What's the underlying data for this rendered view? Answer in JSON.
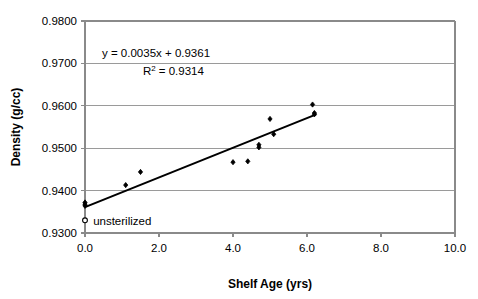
{
  "chart_data": {
    "type": "scatter",
    "title": "",
    "xlabel": "Shelf Age (yrs)",
    "ylabel": "Density (g/cc)",
    "xlim": [
      0.0,
      10.0
    ],
    "ylim": [
      0.93,
      0.98
    ],
    "xticks": [
      "0.0",
      "2.0",
      "4.0",
      "6.0",
      "8.0",
      "10.0"
    ],
    "xtick_values": [
      0.0,
      2.0,
      4.0,
      6.0,
      8.0,
      10.0
    ],
    "yticks": [
      "0.9300",
      "0.9400",
      "0.9500",
      "0.9600",
      "0.9700",
      "0.9800"
    ],
    "ytick_values": [
      0.93,
      0.94,
      0.95,
      0.96,
      0.97,
      0.98
    ],
    "grid": "horizontal",
    "legend": "none",
    "series": [
      {
        "name": "sterilized",
        "marker": "filled-diamond",
        "color": "#000000",
        "points": [
          {
            "x": 0.0,
            "y": 0.9372
          },
          {
            "x": 0.0,
            "y": 0.9368
          },
          {
            "x": 0.0,
            "y": 0.9364
          },
          {
            "x": 1.1,
            "y": 0.9413
          },
          {
            "x": 1.5,
            "y": 0.9444
          },
          {
            "x": 4.0,
            "y": 0.9467
          },
          {
            "x": 4.4,
            "y": 0.9469
          },
          {
            "x": 4.7,
            "y": 0.9508
          },
          {
            "x": 4.7,
            "y": 0.9502
          },
          {
            "x": 5.0,
            "y": 0.9569
          },
          {
            "x": 5.1,
            "y": 0.9533
          },
          {
            "x": 6.15,
            "y": 0.9603
          },
          {
            "x": 6.2,
            "y": 0.9583
          },
          {
            "x": 6.2,
            "y": 0.958
          }
        ]
      },
      {
        "name": "unsterilized",
        "marker": "hollow-circle",
        "color": "#000000",
        "points": [
          {
            "x": 0.0,
            "y": 0.933
          }
        ]
      }
    ],
    "trendline": {
      "equation": "y = 0.0035x + 0.9361",
      "slope": 0.0035,
      "intercept": 0.9361,
      "r_squared_label": "R",
      "r_squared_exponent": "2",
      "r_squared_value": "= 0.9314",
      "r_squared": 0.9314,
      "x_start": 0.0,
      "x_end": 6.25,
      "color": "#000000"
    },
    "annotations": [
      {
        "name": "unsterilized-label",
        "text": "unsterilized",
        "x": 0.22,
        "y": 0.9328
      }
    ]
  },
  "colors": {
    "axis": "#8a8a8a",
    "grid": "#9a9a9a",
    "marker": "#000000",
    "trend": "#000000",
    "background": "#ffffff"
  }
}
